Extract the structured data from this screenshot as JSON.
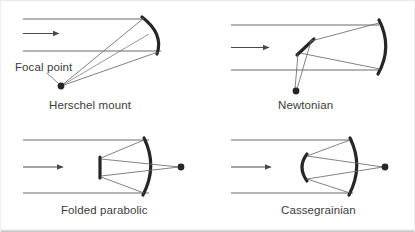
{
  "figure": {
    "background_color": "#ffffff",
    "line_color": "#6b6b6b",
    "mirror_color": "#262626",
    "text_color": "#3b3b3b"
  },
  "panels": [
    {
      "id": "herschel",
      "caption": "Herschel mount",
      "annotation": "Focal point",
      "has_focal_point_label": true,
      "mirror_type": "tilted-concave-arc",
      "focus_position": "below-left-of-mirror"
    },
    {
      "id": "newtonian",
      "caption": "Newtonian",
      "annotation": "",
      "has_focal_point_label": false,
      "mirror_type": "vertical-concave-arc-with-flat-diagonal-secondary",
      "focus_position": "below-axis"
    },
    {
      "id": "folded-parabolic",
      "caption": "Folded parabolic",
      "annotation": "",
      "has_focal_point_label": false,
      "mirror_type": "concave-arc-with-flat-secondary",
      "focus_position": "right-on-axis"
    },
    {
      "id": "cassegrainian",
      "caption": "Cassegrainian",
      "annotation": "",
      "has_focal_point_label": false,
      "mirror_type": "concave-arc-with-convex-secondary",
      "focus_position": "right-on-axis"
    }
  ],
  "ray_arrow": {
    "label": "incoming light direction",
    "count": 4
  }
}
